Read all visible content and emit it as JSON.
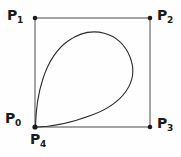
{
  "figure": {
    "kind": "bezier-control-polygon-diagram",
    "background_color": "#fefefe",
    "ink_color": "#1b1b1b",
    "curve_color": "#2b2b2b",
    "polygon_color": "#4a4a4a",
    "labels": {
      "p0": {
        "base": "P",
        "sub": "0",
        "x": 5,
        "y": 111
      },
      "p1": {
        "base": "P",
        "sub": "1",
        "x": 7,
        "y": 8
      },
      "p2": {
        "base": "P",
        "sub": "2",
        "x": 157,
        "y": 8
      },
      "p3": {
        "base": "P",
        "sub": "3",
        "x": 157,
        "y": 116
      },
      "p4": {
        "base": "P",
        "sub": "4",
        "x": 30,
        "y": 132
      }
    },
    "control_points": [
      {
        "name": "P0",
        "x": 35,
        "y": 127
      },
      {
        "name": "P1",
        "x": 35,
        "y": 18
      },
      {
        "name": "P2",
        "x": 150,
        "y": 18
      },
      {
        "name": "P3",
        "x": 150,
        "y": 127
      },
      {
        "name": "P4",
        "x": 35,
        "y": 127
      }
    ],
    "polygon_path": "M 35 18 L 150 18 L 150 127 L 35 127 Z",
    "curve_path": "M 35.5 127 C 36 96 44 58 68 41 C 92 24 120 32 130 57 C 140 82 122 104 92 115 C 68 124 48 127 35.5 127 Z",
    "dot_radius": 2.3,
    "curve_stroke_width": 1.1,
    "polygon_stroke_width": 1.0
  }
}
